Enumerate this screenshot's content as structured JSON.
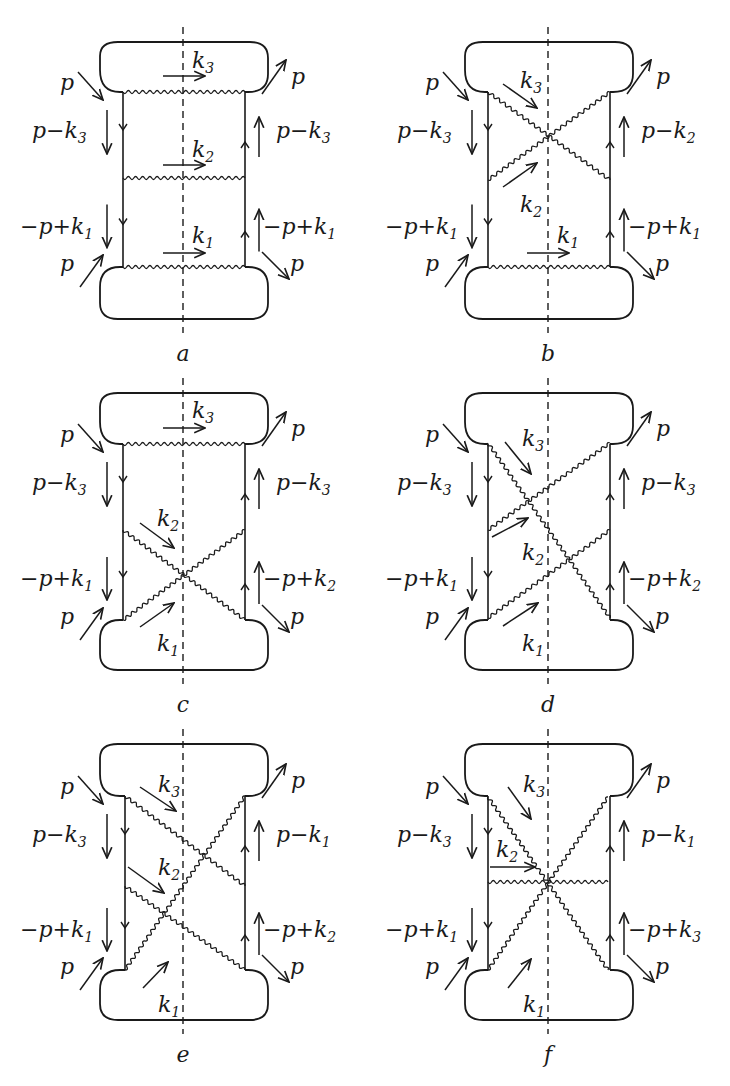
{
  "figure": {
    "stroke_color": "#1a1a1a",
    "background": "#ffffff"
  },
  "diagrams": [
    {
      "id": "a",
      "caption": "a",
      "ox": 0,
      "oy": 0,
      "left_labels": [
        "p",
        "p−k",
        "3",
        "−p+k",
        "1",
        "p"
      ],
      "right_labels": [
        "p",
        "p−k",
        "3",
        "−p+k",
        "1",
        "p"
      ],
      "photons": [
        [
          123,
          92,
          245,
          92
        ],
        [
          123,
          178,
          245,
          178
        ],
        [
          123,
          267,
          245,
          267
        ]
      ],
      "momentum_arrows": [
        {
          "x1": 163,
          "y1": 76,
          "x2": 205,
          "y2": 76,
          "label": "k",
          "sub": "3",
          "lx": 192,
          "ly": 68
        },
        {
          "x1": 163,
          "y1": 165,
          "x2": 205,
          "y2": 165,
          "label": "k",
          "sub": "2",
          "lx": 192,
          "ly": 157
        },
        {
          "x1": 163,
          "y1": 253,
          "x2": 205,
          "y2": 253,
          "label": "k",
          "sub": "1",
          "lx": 192,
          "ly": 243
        }
      ]
    },
    {
      "id": "b",
      "caption": "b",
      "ox": 365,
      "oy": 0,
      "left_labels": [
        "p",
        "p−k",
        "3",
        "−p+k",
        "1",
        "p"
      ],
      "right_labels": [
        "p",
        "p−k",
        "2",
        "−p+k",
        "1",
        "p"
      ],
      "photons": [
        [
          123,
          92,
          245,
          180
        ],
        [
          123,
          180,
          245,
          92
        ],
        [
          123,
          267,
          245,
          267
        ]
      ],
      "momentum_arrows": [
        {
          "x1": 138,
          "y1": 84,
          "x2": 172,
          "y2": 108,
          "label": "k",
          "sub": "3",
          "lx": 155,
          "ly": 88
        },
        {
          "x1": 138,
          "y1": 187,
          "x2": 172,
          "y2": 163,
          "label": "k",
          "sub": "2",
          "lx": 155,
          "ly": 212
        },
        {
          "x1": 162,
          "y1": 253,
          "x2": 204,
          "y2": 253,
          "label": "k",
          "sub": "1",
          "lx": 192,
          "ly": 243
        }
      ]
    },
    {
      "id": "c",
      "caption": "c",
      "ox": 0,
      "oy": 360,
      "left_labels": [
        "p",
        "p−k",
        "3",
        "−p+k",
        "1",
        "p"
      ],
      "right_labels": [
        "p",
        "p−k",
        "3",
        "−p+k",
        "2",
        "p"
      ],
      "photons": [
        [
          123,
          84,
          245,
          84
        ],
        [
          123,
          170,
          245,
          260
        ],
        [
          123,
          260,
          245,
          170
        ]
      ],
      "momentum_arrows": [
        {
          "x1": 163,
          "y1": 68,
          "x2": 205,
          "y2": 68,
          "label": "k",
          "sub": "3",
          "lx": 192,
          "ly": 58
        },
        {
          "x1": 140,
          "y1": 163,
          "x2": 174,
          "y2": 188,
          "label": "k",
          "sub": "2",
          "lx": 157,
          "ly": 166
        },
        {
          "x1": 140,
          "y1": 267,
          "x2": 174,
          "y2": 243,
          "label": "k",
          "sub": "1",
          "lx": 157,
          "ly": 291
        }
      ]
    },
    {
      "id": "d",
      "caption": "d",
      "ox": 365,
      "oy": 360,
      "left_labels": [
        "p",
        "p−k",
        "3",
        "−p+k",
        "1",
        "p"
      ],
      "right_labels": [
        "p",
        "p−k",
        "3",
        "−p+k",
        "2",
        "p"
      ],
      "photons": [
        [
          123,
          83,
          245,
          258
        ],
        [
          123,
          170,
          245,
          83
        ],
        [
          123,
          258,
          245,
          170
        ]
      ],
      "momentum_arrows": [
        {
          "x1": 140,
          "y1": 82,
          "x2": 166,
          "y2": 114,
          "label": "k",
          "sub": "3",
          "lx": 157,
          "ly": 86
        },
        {
          "x1": 127,
          "y1": 177,
          "x2": 163,
          "y2": 158,
          "label": "k",
          "sub": "2",
          "lx": 157,
          "ly": 200
        },
        {
          "x1": 138,
          "y1": 266,
          "x2": 173,
          "y2": 243,
          "label": "k",
          "sub": "1",
          "lx": 157,
          "ly": 291
        }
      ]
    },
    {
      "id": "e",
      "caption": "e",
      "ox": 0,
      "oy": 720,
      "left_labels": [
        "p",
        "p−k",
        "3",
        "−p+k",
        "1",
        "p"
      ],
      "right_labels": [
        "p",
        "p−k",
        "1",
        "−p+k",
        "2",
        "p"
      ],
      "photons": [
        [
          125,
          76,
          245,
          166
        ],
        [
          125,
          166,
          245,
          250
        ],
        [
          125,
          250,
          245,
          76
        ]
      ],
      "momentum_arrows": [
        {
          "x1": 140,
          "y1": 67,
          "x2": 176,
          "y2": 91,
          "label": "k",
          "sub": "3",
          "lx": 158,
          "ly": 72
        },
        {
          "x1": 128,
          "y1": 147,
          "x2": 164,
          "y2": 173,
          "label": "k",
          "sub": "2",
          "lx": 158,
          "ly": 155
        },
        {
          "x1": 143,
          "y1": 268,
          "x2": 168,
          "y2": 242,
          "label": "k",
          "sub": "1",
          "lx": 158,
          "ly": 292
        }
      ]
    },
    {
      "id": "f",
      "caption": "f",
      "ox": 365,
      "oy": 720,
      "left_labels": [
        "p",
        "p−k",
        "3",
        "−p+k",
        "1",
        "p"
      ],
      "right_labels": [
        "p",
        "p−k",
        "1",
        "−p+k",
        "3",
        "p"
      ],
      "photons": [
        [
          123,
          77,
          183,
          163
        ],
        [
          123,
          162,
          243,
          162
        ],
        [
          123,
          250,
          183,
          163
        ],
        [
          243,
          77,
          183,
          163
        ],
        [
          243,
          250,
          183,
          163
        ]
      ],
      "momentum_arrows": [
        {
          "x1": 143,
          "y1": 67,
          "x2": 166,
          "y2": 99,
          "label": "k",
          "sub": "3",
          "lx": 158,
          "ly": 72
        },
        {
          "x1": 125,
          "y1": 147,
          "x2": 170,
          "y2": 147,
          "label": "k",
          "sub": "2",
          "lx": 131,
          "ly": 137
        },
        {
          "x1": 143,
          "y1": 268,
          "x2": 166,
          "y2": 239,
          "label": "k",
          "sub": "1",
          "lx": 158,
          "ly": 292
        }
      ]
    }
  ]
}
